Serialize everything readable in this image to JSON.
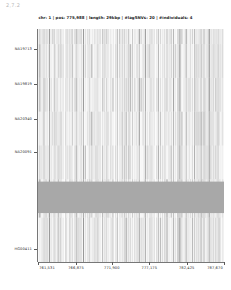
{
  "corner_tag": "2,7.2",
  "header": {
    "title": "chr: 1  |  pos: 775,988  |  length: 29kbp  |  #lagSNVs: 20  |  #individuals: 4",
    "chromosome": "1",
    "position": "775,988",
    "length": "29kbp",
    "lag_snvs": "20",
    "individuals": "4"
  },
  "chart_data": {
    "type": "heatmap",
    "title": "chr: 1  |  pos: 775,988  |  length: 29kbp  |  #lagSNVs: 20  |  #individuals: 4",
    "xlabel": "",
    "ylabel": "",
    "grid": false,
    "legend_position": "none",
    "xlim": [
      761531,
      787670
    ],
    "x_tick_labels": [
      "761,531",
      "766,875",
      "771,900",
      "777,175",
      "782,425",
      "787,670"
    ],
    "x_tick_values": [
      761531,
      766875,
      771900,
      777175,
      782425,
      787670
    ],
    "y_tick_labels": [
      "NA19713",
      "NA19819",
      "NA20340",
      "NA20091",
      "HG00411"
    ],
    "y_tick_positions": [
      0.915,
      0.765,
      0.615,
      0.47,
      0.055
    ],
    "colorscale": [
      "#ffffff",
      "#9a9a9a",
      "#4a4a4a"
    ],
    "highlight_band": {
      "label": "masked-region",
      "y_start": 0.21,
      "y_end": 0.345,
      "color": "#a8a8a8"
    },
    "columns": [
      {
        "x": 0.004,
        "w": 0.01,
        "v": 0.22
      },
      {
        "x": 0.018,
        "w": 0.006,
        "v": 0.1
      },
      {
        "x": 0.03,
        "w": 0.004,
        "v": 0.62
      },
      {
        "x": 0.04,
        "w": 0.007,
        "v": 0.18
      },
      {
        "x": 0.052,
        "w": 0.005,
        "v": 0.08
      },
      {
        "x": 0.061,
        "w": 0.004,
        "v": 0.7
      },
      {
        "x": 0.07,
        "w": 0.009,
        "v": 0.14
      },
      {
        "x": 0.086,
        "w": 0.005,
        "v": 0.3
      },
      {
        "x": 0.096,
        "w": 0.004,
        "v": 0.12
      },
      {
        "x": 0.106,
        "w": 0.01,
        "v": 0.2
      },
      {
        "x": 0.122,
        "w": 0.004,
        "v": 0.55
      },
      {
        "x": 0.131,
        "w": 0.008,
        "v": 0.11
      },
      {
        "x": 0.146,
        "w": 0.005,
        "v": 0.26
      },
      {
        "x": 0.157,
        "w": 0.006,
        "v": 0.09
      },
      {
        "x": 0.17,
        "w": 0.004,
        "v": 0.48
      },
      {
        "x": 0.18,
        "w": 0.009,
        "v": 0.16
      },
      {
        "x": 0.196,
        "w": 0.005,
        "v": 0.24
      },
      {
        "x": 0.207,
        "w": 0.004,
        "v": 0.62
      },
      {
        "x": 0.216,
        "w": 0.008,
        "v": 0.1
      },
      {
        "x": 0.231,
        "w": 0.005,
        "v": 0.28
      },
      {
        "x": 0.242,
        "w": 0.004,
        "v": 0.58
      },
      {
        "x": 0.251,
        "w": 0.007,
        "v": 0.13
      },
      {
        "x": 0.264,
        "w": 0.005,
        "v": 0.34
      },
      {
        "x": 0.275,
        "w": 0.004,
        "v": 0.66
      },
      {
        "x": 0.284,
        "w": 0.009,
        "v": 0.15
      },
      {
        "x": 0.3,
        "w": 0.004,
        "v": 0.72
      },
      {
        "x": 0.309,
        "w": 0.006,
        "v": 0.19
      },
      {
        "x": 0.321,
        "w": 0.004,
        "v": 0.52
      },
      {
        "x": 0.33,
        "w": 0.008,
        "v": 0.12
      },
      {
        "x": 0.345,
        "w": 0.005,
        "v": 0.3
      },
      {
        "x": 0.356,
        "w": 0.004,
        "v": 0.6
      },
      {
        "x": 0.365,
        "w": 0.007,
        "v": 0.17
      },
      {
        "x": 0.378,
        "w": 0.005,
        "v": 0.25
      },
      {
        "x": 0.389,
        "w": 0.004,
        "v": 0.55
      },
      {
        "x": 0.398,
        "w": 0.01,
        "v": 0.11
      },
      {
        "x": 0.415,
        "w": 0.005,
        "v": 0.32
      },
      {
        "x": 0.426,
        "w": 0.004,
        "v": 0.64
      },
      {
        "x": 0.435,
        "w": 0.008,
        "v": 0.14
      },
      {
        "x": 0.45,
        "w": 0.005,
        "v": 0.27
      },
      {
        "x": 0.461,
        "w": 0.004,
        "v": 0.5
      },
      {
        "x": 0.47,
        "w": 0.009,
        "v": 0.16
      },
      {
        "x": 0.486,
        "w": 0.004,
        "v": 0.68
      },
      {
        "x": 0.495,
        "w": 0.006,
        "v": 0.2
      },
      {
        "x": 0.507,
        "w": 0.004,
        "v": 0.44
      },
      {
        "x": 0.516,
        "w": 0.008,
        "v": 0.12
      },
      {
        "x": 0.531,
        "w": 0.005,
        "v": 0.29
      },
      {
        "x": 0.542,
        "w": 0.004,
        "v": 0.57
      },
      {
        "x": 0.551,
        "w": 0.007,
        "v": 0.15
      },
      {
        "x": 0.564,
        "w": 0.005,
        "v": 0.23
      },
      {
        "x": 0.575,
        "w": 0.004,
        "v": 0.61
      },
      {
        "x": 0.584,
        "w": 0.009,
        "v": 0.13
      },
      {
        "x": 0.6,
        "w": 0.005,
        "v": 0.31
      },
      {
        "x": 0.611,
        "w": 0.004,
        "v": 0.53
      },
      {
        "x": 0.62,
        "w": 0.008,
        "v": 0.1
      },
      {
        "x": 0.635,
        "w": 0.005,
        "v": 0.26
      },
      {
        "x": 0.646,
        "w": 0.004,
        "v": 0.65
      },
      {
        "x": 0.655,
        "w": 0.007,
        "v": 0.18
      },
      {
        "x": 0.668,
        "w": 0.005,
        "v": 0.22
      },
      {
        "x": 0.679,
        "w": 0.004,
        "v": 0.47
      },
      {
        "x": 0.688,
        "w": 0.01,
        "v": 0.14
      },
      {
        "x": 0.705,
        "w": 0.004,
        "v": 0.59
      },
      {
        "x": 0.714,
        "w": 0.006,
        "v": 0.21
      },
      {
        "x": 0.726,
        "w": 0.004,
        "v": 0.42
      },
      {
        "x": 0.735,
        "w": 0.008,
        "v": 0.11
      },
      {
        "x": 0.75,
        "w": 0.005,
        "v": 0.33
      },
      {
        "x": 0.761,
        "w": 0.004,
        "v": 0.56
      },
      {
        "x": 0.77,
        "w": 0.007,
        "v": 0.16
      },
      {
        "x": 0.783,
        "w": 0.005,
        "v": 0.24
      },
      {
        "x": 0.794,
        "w": 0.004,
        "v": 0.63
      },
      {
        "x": 0.803,
        "w": 0.009,
        "v": 0.12
      },
      {
        "x": 0.819,
        "w": 0.004,
        "v": 0.51
      },
      {
        "x": 0.828,
        "w": 0.006,
        "v": 0.19
      },
      {
        "x": 0.84,
        "w": 0.004,
        "v": 0.45
      },
      {
        "x": 0.849,
        "w": 0.008,
        "v": 0.13
      },
      {
        "x": 0.864,
        "w": 0.005,
        "v": 0.28
      },
      {
        "x": 0.875,
        "w": 0.004,
        "v": 0.74
      },
      {
        "x": 0.883,
        "w": 0.004,
        "v": 0.7
      },
      {
        "x": 0.891,
        "w": 0.004,
        "v": 0.76
      },
      {
        "x": 0.899,
        "w": 0.004,
        "v": 0.68
      },
      {
        "x": 0.907,
        "w": 0.005,
        "v": 0.3
      },
      {
        "x": 0.918,
        "w": 0.004,
        "v": 0.72
      },
      {
        "x": 0.926,
        "w": 0.004,
        "v": 0.66
      },
      {
        "x": 0.934,
        "w": 0.005,
        "v": 0.25
      },
      {
        "x": 0.945,
        "w": 0.004,
        "v": 0.71
      },
      {
        "x": 0.953,
        "w": 0.006,
        "v": 0.17
      },
      {
        "x": 0.965,
        "w": 0.004,
        "v": 0.6
      },
      {
        "x": 0.974,
        "w": 0.008,
        "v": 0.14
      },
      {
        "x": 0.988,
        "w": 0.005,
        "v": 0.22
      }
    ],
    "row_breaks": [
      0.19,
      0.355,
      0.5,
      0.645,
      0.79,
      0.935
    ]
  }
}
